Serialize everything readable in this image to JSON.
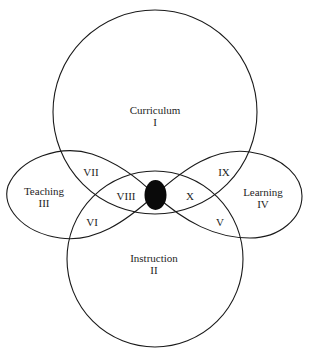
{
  "diagram": {
    "type": "venn-figure-eight",
    "stroke_color": "#1a1a1a",
    "center_dot_color": "#0a0a0a",
    "sets": [
      {
        "id": "curriculum",
        "name": "Curriculum",
        "numeral": "I"
      },
      {
        "id": "instruction",
        "name": "Instruction",
        "numeral": "II"
      },
      {
        "id": "teaching",
        "name": "Teaching",
        "numeral": "III"
      },
      {
        "id": "learning",
        "name": "Learning",
        "numeral": "IV"
      }
    ],
    "regions": {
      "r5": "V",
      "r6": "VI",
      "r7": "VII",
      "r8": "VIII",
      "r9": "IX",
      "r10": "X"
    }
  }
}
